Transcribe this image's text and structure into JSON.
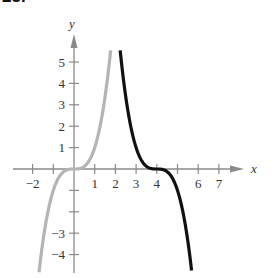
{
  "heading": "25.",
  "chart_data": {
    "type": "line",
    "title": "",
    "xlabel": "x",
    "ylabel": "y",
    "xlim": [
      -2.9,
      8.0
    ],
    "ylim": [
      -4.9,
      6.2
    ],
    "x_tick_positions": [
      -2,
      -1,
      1,
      2,
      3,
      4,
      5,
      6,
      7
    ],
    "x_tick_labels": [
      "-2",
      "",
      "1",
      "2",
      "3",
      "4",
      "",
      "6",
      "7"
    ],
    "y_tick_positions": [
      -4,
      -3,
      -2,
      -1,
      1,
      2,
      3,
      4,
      5
    ],
    "y_tick_labels": [
      "−4",
      "−3",
      "",
      "",
      "1",
      "2",
      "3",
      "4",
      "5"
    ],
    "grid": false,
    "legend": null,
    "series": [
      {
        "name": "y = x^3",
        "color": "#b4b4b4",
        "x": [
          -1.69,
          -1.5,
          -1.0,
          -0.5,
          0,
          0.5,
          1.0,
          1.5,
          1.77
        ],
        "y": [
          -4.83,
          -3.38,
          -1.0,
          -0.13,
          0,
          0.13,
          1.0,
          3.38,
          5.55
        ]
      },
      {
        "name": "y = -(x-4)^3",
        "color": "#111111",
        "x": [
          2.23,
          2.5,
          3.0,
          3.5,
          4.0,
          4.5,
          5.0,
          5.5,
          5.68
        ],
        "y": [
          5.55,
          3.38,
          1.0,
          0.13,
          0,
          -0.13,
          -1.0,
          -3.38,
          -4.74
        ]
      }
    ]
  },
  "colors": {
    "axis": "#8a8a8a",
    "curve_light": "#b4b4b4",
    "curve_dark": "#111111"
  }
}
